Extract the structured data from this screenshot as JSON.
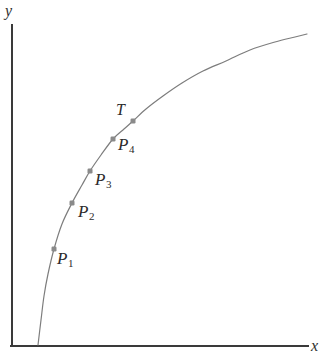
{
  "chart_data": {
    "type": "line",
    "title": "",
    "xlabel": "x",
    "ylabel": "y",
    "grid": false,
    "legend": null,
    "curve": {
      "name": "curve",
      "color": "#7d7d7d",
      "stroke_width": 1.2,
      "shape": "concave-increasing",
      "path_points": [
        [
          38,
          345
        ],
        [
          41,
          320
        ],
        [
          44,
          296
        ],
        [
          48,
          274
        ],
        [
          54,
          249
        ],
        [
          62,
          224
        ],
        [
          72,
          203
        ],
        [
          82,
          185
        ],
        [
          90,
          171
        ],
        [
          101,
          155
        ],
        [
          113,
          139
        ],
        [
          124,
          129
        ],
        [
          133,
          121
        ],
        [
          146,
          109
        ],
        [
          163,
          96
        ],
        [
          182,
          83
        ],
        [
          203,
          71
        ],
        [
          226,
          61
        ],
        [
          250,
          50
        ],
        [
          275,
          42
        ],
        [
          295,
          37
        ],
        [
          307,
          34
        ]
      ]
    },
    "markers": [
      {
        "id": "P1",
        "label": "P",
        "subscript": "1",
        "x": 54,
        "y": 249,
        "label_x": 57,
        "label_y": 250
      },
      {
        "id": "P2",
        "label": "P",
        "subscript": "2",
        "x": 72,
        "y": 203,
        "label_x": 78,
        "label_y": 203
      },
      {
        "id": "P3",
        "label": "P",
        "subscript": "3",
        "x": 90,
        "y": 171,
        "label_x": 95,
        "label_y": 171
      },
      {
        "id": "P4",
        "label": "P",
        "subscript": "4",
        "x": 113,
        "y": 139,
        "label_x": 118,
        "label_y": 136
      },
      {
        "id": "T",
        "label": "T",
        "subscript": "",
        "x": 133,
        "y": 121,
        "label_x": 116,
        "label_y": 102
      }
    ],
    "marker_style": {
      "color": "#8a8a8a",
      "size": 5,
      "shape": "square-dot"
    },
    "axes": {
      "color": "#3a3a3a",
      "stroke_width": 2,
      "y_axis": {
        "x": 12,
        "y_top": 25,
        "y_bottom": 346
      },
      "x_axis": {
        "y": 346,
        "x_left": 12,
        "x_right": 308
      }
    }
  },
  "labels": {
    "y_axis": "y",
    "x_axis": "x",
    "P1_base": "P",
    "P1_sub": "1",
    "P2_base": "P",
    "P2_sub": "2",
    "P3_base": "P",
    "P3_sub": "3",
    "P4_base": "P",
    "P4_sub": "4",
    "T": "T"
  },
  "colors": {
    "background": "#ffffff",
    "curve": "#7d7d7d",
    "marker": "#8a8a8a",
    "axis": "#3a3a3a",
    "text": "#2b2b2b"
  }
}
